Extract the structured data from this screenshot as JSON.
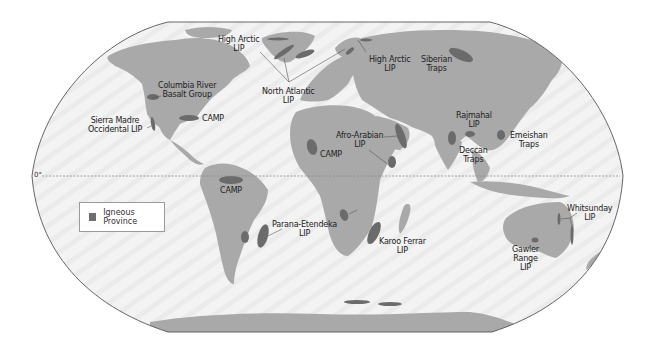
{
  "map": {
    "title": "Large Igneous Provinces of the World",
    "projection": "Robinson (world)",
    "colors": {
      "ocean": "#f2f2f2",
      "land": "#a9a9a9",
      "igneous": "#6b6b6b",
      "outline": "#555555",
      "equator": "#9a9a9a"
    },
    "equator_label": "0°",
    "legend": {
      "label": "Igneous Province"
    },
    "provinces": [
      {
        "id": "high-arctic-lip-west",
        "line1": "High Arctic",
        "line2": "LIP"
      },
      {
        "id": "columbia-river",
        "line1": "Columbia River",
        "line2": "Basalt Group"
      },
      {
        "id": "sierra-madre",
        "line1": "Sierra Madre",
        "line2": "Occidental LIP"
      },
      {
        "id": "camp-na",
        "line1": "CAMP",
        "line2": ""
      },
      {
        "id": "north-atlantic",
        "line1": "North Atlantic",
        "line2": "LIP"
      },
      {
        "id": "high-arctic-lip-east",
        "line1": "High Arctic",
        "line2": "LIP"
      },
      {
        "id": "siberian-traps",
        "line1": "Siberian",
        "line2": "Traps"
      },
      {
        "id": "afro-arabian",
        "line1": "Afro-Arabian",
        "line2": "LIP"
      },
      {
        "id": "camp-africa",
        "line1": "CAMP",
        "line2": ""
      },
      {
        "id": "rajmahal",
        "line1": "Rajmahal",
        "line2": "LIP"
      },
      {
        "id": "deccan",
        "line1": "Deccan",
        "line2": "Traps"
      },
      {
        "id": "emeishan",
        "line1": "Emeishan",
        "line2": "Traps"
      },
      {
        "id": "camp-sa",
        "line1": "CAMP",
        "line2": ""
      },
      {
        "id": "parana-etendeka",
        "line1": "Parana-Etendeka",
        "line2": "LIP"
      },
      {
        "id": "karoo-ferrar",
        "line1": "Karoo Ferrar",
        "line2": "LIP"
      },
      {
        "id": "whitsunday",
        "line1": "Whitsunday",
        "line2": "LIP"
      },
      {
        "id": "gawler-range",
        "line1": "Gawler",
        "line2": "Range",
        "line3": "LIP"
      }
    ]
  }
}
